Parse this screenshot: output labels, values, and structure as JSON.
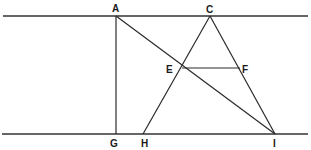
{
  "diagram": {
    "type": "geometric-construction",
    "points": {
      "A": {
        "label": "A",
        "x": 116,
        "y": 16
      },
      "C": {
        "label": "C",
        "x": 210,
        "y": 16
      },
      "E": {
        "label": "E",
        "x": 182,
        "y": 68
      },
      "F": {
        "label": "F",
        "x": 240,
        "y": 68
      },
      "G": {
        "label": "G",
        "x": 116,
        "y": 134
      },
      "H": {
        "label": "H",
        "x": 143,
        "y": 134
      },
      "I": {
        "label": "I",
        "x": 275,
        "y": 134
      }
    },
    "segments": [
      {
        "name": "top-parallel-line",
        "from": [
          3,
          16
        ],
        "to": [
          308,
          16
        ]
      },
      {
        "name": "bottom-parallel-line",
        "from": [
          2,
          134
        ],
        "to": [
          308,
          134
        ]
      },
      {
        "name": "segment-AG",
        "from": "A",
        "to": "G"
      },
      {
        "name": "segment-AI",
        "from": "A",
        "to": "I"
      },
      {
        "name": "segment-CH",
        "from": "C",
        "to": "H"
      },
      {
        "name": "segment-CI",
        "from": "C",
        "to": "I"
      },
      {
        "name": "segment-EF",
        "from": "E",
        "to": "F"
      }
    ],
    "labels": {
      "A": "A",
      "C": "C",
      "E": "E",
      "F": "F",
      "G": "G",
      "H": "H",
      "I": "I"
    }
  }
}
